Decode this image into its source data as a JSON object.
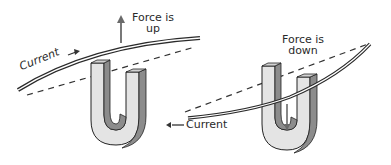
{
  "left_panel": {
    "force_label_line1": "Force is",
    "force_label_line2": "up",
    "current_label": "Current",
    "current_direction": "right",
    "force_direction": "up"
  },
  "right_panel": {
    "force_label_line1": "Force is",
    "force_label_line2": "down",
    "current_label": "Current",
    "current_direction": "left",
    "force_direction": "down"
  },
  "colors": {
    "magnet_light": "#e4e4e4",
    "magnet_dark": "#8c8c8c",
    "magnet_top": "#d2d2d2",
    "wire": "#2a2a2a",
    "arrow": "#6a6a6a"
  }
}
